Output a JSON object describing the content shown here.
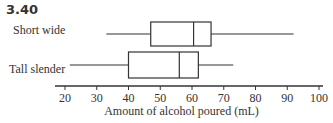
{
  "figure": {
    "title": "3.40"
  },
  "chart_data": {
    "type": "boxplot",
    "orientation": "horizontal",
    "title": "3.40",
    "xlabel": "Amount of alcohol poured (mL)",
    "ylabel": "",
    "xlim": [
      20,
      100
    ],
    "xticks": [
      20,
      30,
      40,
      50,
      60,
      70,
      80,
      90,
      100
    ],
    "grid": false,
    "series": [
      {
        "name": "Short wide",
        "min": 33,
        "q1": 47,
        "median": 60.5,
        "q3": 66,
        "max": 92
      },
      {
        "name": "Tall slender",
        "min": 21.5,
        "q1": 40,
        "median": 56,
        "q3": 62,
        "max": 73
      }
    ]
  }
}
